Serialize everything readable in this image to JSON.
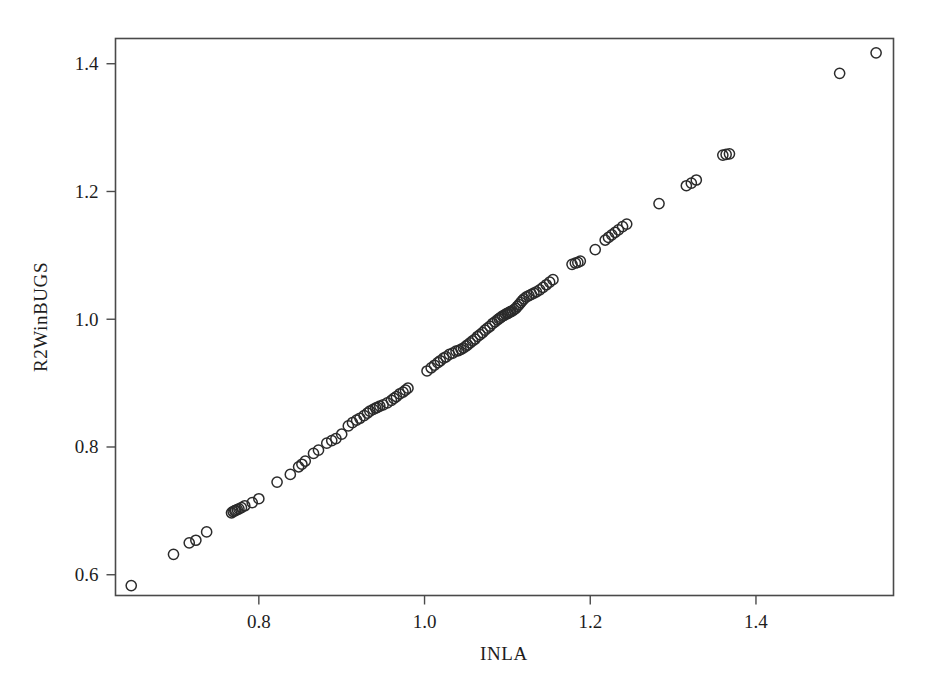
{
  "chart_data": {
    "type": "scatter",
    "title": "",
    "xlabel": "INLA",
    "ylabel": "R2WinBUGS",
    "xlim": [
      0.627,
      1.566
    ],
    "ylim": [
      0.5675,
      1.4395
    ],
    "xticks": [
      0.8,
      1.0,
      1.2,
      1.4
    ],
    "xtick_labels": [
      "0.8",
      "1.0",
      "1.2",
      "1.4"
    ],
    "yticks": [
      0.6,
      0.8,
      1.0,
      1.2,
      1.4
    ],
    "ytick_labels": [
      "0.6",
      "0.8",
      "1.0",
      "1.2",
      "1.4"
    ],
    "grid": false,
    "legend": null,
    "marker": "open-circle",
    "marker_color": "#2b2b2b",
    "marker_fill": "none",
    "frame_color": "#4a4a4a",
    "background_color": "#ffffff",
    "n_points": 121,
    "x": [
      0.646,
      0.697,
      0.716,
      0.724,
      0.737,
      0.767,
      0.769,
      0.771,
      0.772,
      0.774,
      0.776,
      0.779,
      0.783,
      0.792,
      0.8,
      0.822,
      0.838,
      0.848,
      0.852,
      0.856,
      0.866,
      0.872,
      0.882,
      0.888,
      0.893,
      0.9,
      0.908,
      0.913,
      0.918,
      0.922,
      0.927,
      0.931,
      0.934,
      0.938,
      0.941,
      0.943,
      0.946,
      0.95,
      0.955,
      0.96,
      0.963,
      0.966,
      0.97,
      0.974,
      0.977,
      0.98,
      1.003,
      1.008,
      1.012,
      1.016,
      1.019,
      1.023,
      1.026,
      1.03,
      1.034,
      1.038,
      1.041,
      1.044,
      1.047,
      1.05,
      1.052,
      1.055,
      1.058,
      1.061,
      1.064,
      1.067,
      1.07,
      1.073,
      1.076,
      1.079,
      1.082,
      1.085,
      1.088,
      1.09,
      1.092,
      1.094,
      1.096,
      1.098,
      1.1,
      1.101,
      1.103,
      1.104,
      1.106,
      1.108,
      1.11,
      1.112,
      1.114,
      1.116,
      1.118,
      1.12,
      1.123,
      1.126,
      1.129,
      1.132,
      1.135,
      1.139,
      1.143,
      1.147,
      1.151,
      1.155,
      1.178,
      1.182,
      1.185,
      1.188,
      1.206,
      1.218,
      1.222,
      1.226,
      1.23,
      1.234,
      1.239,
      1.244,
      1.283,
      1.316,
      1.322,
      1.328,
      1.36,
      1.364,
      1.368,
      1.501,
      1.545
    ],
    "y": [
      0.583,
      0.632,
      0.65,
      0.654,
      0.667,
      0.697,
      0.699,
      0.7,
      0.701,
      0.702,
      0.703,
      0.705,
      0.708,
      0.713,
      0.719,
      0.745,
      0.757,
      0.769,
      0.773,
      0.778,
      0.79,
      0.795,
      0.806,
      0.81,
      0.813,
      0.82,
      0.833,
      0.838,
      0.842,
      0.845,
      0.849,
      0.853,
      0.856,
      0.859,
      0.861,
      0.862,
      0.864,
      0.866,
      0.869,
      0.873,
      0.876,
      0.879,
      0.883,
      0.886,
      0.889,
      0.892,
      0.919,
      0.924,
      0.928,
      0.932,
      0.935,
      0.939,
      0.941,
      0.945,
      0.947,
      0.95,
      0.951,
      0.953,
      0.955,
      0.958,
      0.96,
      0.963,
      0.966,
      0.969,
      0.973,
      0.976,
      0.979,
      0.983,
      0.986,
      0.989,
      0.993,
      0.996,
      0.999,
      1.001,
      1.003,
      1.005,
      1.006,
      1.008,
      1.009,
      1.01,
      1.011,
      1.012,
      1.013,
      1.015,
      1.017,
      1.02,
      1.023,
      1.026,
      1.029,
      1.032,
      1.035,
      1.037,
      1.039,
      1.041,
      1.043,
      1.046,
      1.05,
      1.054,
      1.058,
      1.062,
      1.086,
      1.088,
      1.089,
      1.091,
      1.109,
      1.124,
      1.128,
      1.132,
      1.136,
      1.14,
      1.145,
      1.149,
      1.181,
      1.209,
      1.213,
      1.218,
      1.257,
      1.258,
      1.259,
      1.385,
      1.417
    ]
  }
}
